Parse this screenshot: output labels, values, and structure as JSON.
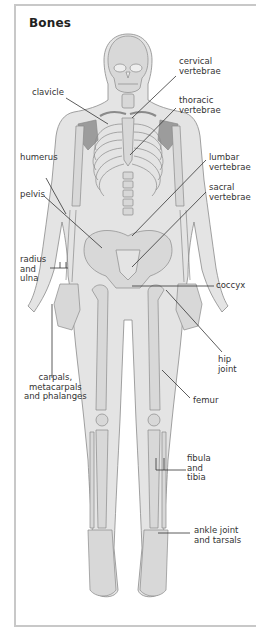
{
  "title": "Bones",
  "colors": {
    "frame_border": "#c8c8c8",
    "body_fill": "#e4e4e4",
    "bone_fill": "#d8d8d8",
    "scapula_fill": "#9c9c9c",
    "outline": "#8a8a8a",
    "leader_line": "#333333",
    "text": "#333333"
  },
  "labels": [
    {
      "id": "cervical-vertebrae",
      "text": "cervical\nvertebrae"
    },
    {
      "id": "clavicle",
      "text": "clavicle"
    },
    {
      "id": "thoracic-vertebrae",
      "text": "thoracic\nvertebrae"
    },
    {
      "id": "humerus",
      "text": "humerus"
    },
    {
      "id": "lumbar-vertebrae",
      "text": "lumbar\nvertebrae"
    },
    {
      "id": "pelvis",
      "text": "pelvis"
    },
    {
      "id": "sacral-vertebrae",
      "text": "sacral\nvertebrae"
    },
    {
      "id": "radius-and-ulna",
      "text": "radius\nand\nulna"
    },
    {
      "id": "coccyx",
      "text": "coccyx"
    },
    {
      "id": "hip-joint",
      "text": "hip\njoint"
    },
    {
      "id": "carpals-metacarpals-phalanges",
      "text": "carpals,\nmetacarpals\nand phalanges"
    },
    {
      "id": "femur",
      "text": "femur"
    },
    {
      "id": "fibula-and-tibia",
      "text": "fibula\nand\ntibia"
    },
    {
      "id": "ankle-joint-and-tarsals",
      "text": "ankle joint\nand tarsals"
    }
  ]
}
